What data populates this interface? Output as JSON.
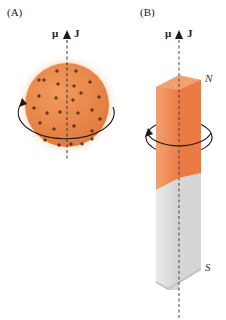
{
  "panels": [
    {
      "label": "(A)",
      "axis": {
        "mu_label": "μ",
        "j_label": "J"
      },
      "object": "charged-spinning-sphere",
      "charge_symbol": "+",
      "rotation": "counterclockwise-viewed-from-top"
    },
    {
      "label": "(B)",
      "axis": {
        "mu_label": "μ",
        "j_label": "J"
      },
      "object": "bar-magnet",
      "north_label": "N",
      "south_label": "S",
      "rotation": "counterclockwise-viewed-from-top"
    }
  ],
  "colors": {
    "sphere": "#e8824a",
    "sphere_glow": "#f6c99c",
    "bar_north": "#ec7a44",
    "bar_north_side": "#f19a68",
    "bar_south": "#d7d7d7",
    "bar_south_side": "#ececec",
    "lines": "#222222"
  }
}
